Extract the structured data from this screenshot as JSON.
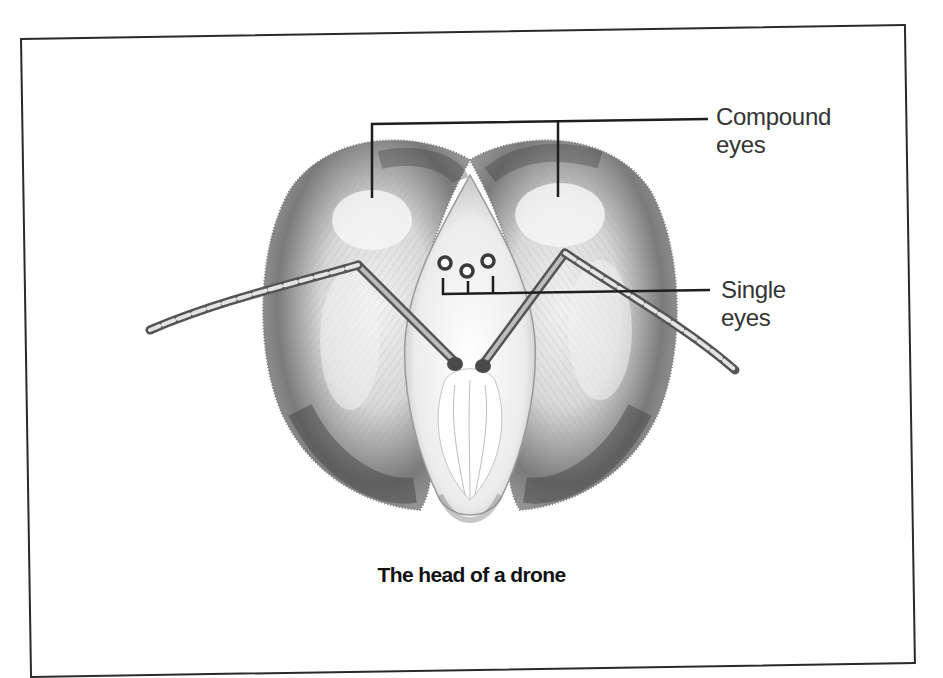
{
  "figure": {
    "caption": "The head of a drone",
    "labels": {
      "compound_eyes": {
        "line1": "Compound",
        "line2": "eyes"
      },
      "single_eyes": {
        "line1": "Single",
        "line2": "eyes"
      }
    },
    "colors": {
      "ink": "#2a2a2a",
      "label_text": "#333333",
      "caption_text": "#111111",
      "background": "#ffffff"
    }
  }
}
